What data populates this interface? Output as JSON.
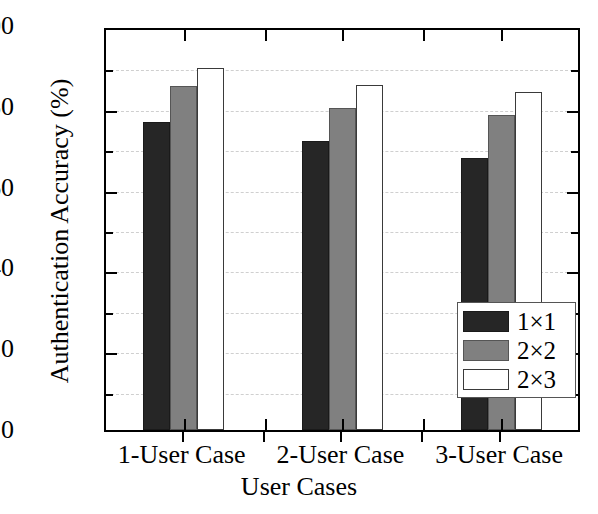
{
  "chart_data": {
    "type": "bar",
    "title": "",
    "xlabel": "User Cases",
    "ylabel": "Authentication Accuracy (%)",
    "categories": [
      "1-User Case",
      "2-User Case",
      "3-User Case"
    ],
    "series": [
      {
        "name": "1×1",
        "color": "#262626",
        "values": [
          76.2,
          71.5,
          67.3
        ]
      },
      {
        "name": "2×2",
        "color": "#808080",
        "values": [
          85.2,
          79.6,
          78.0
        ]
      },
      {
        "name": "2×3",
        "color": "#ffffff",
        "values": [
          89.7,
          85.5,
          83.6
        ]
      }
    ],
    "ylim": [
      0,
      100
    ],
    "ytick_labels": [
      "0",
      "20",
      "40",
      "60",
      "80",
      "100"
    ],
    "ytick_values": [
      0,
      20,
      40,
      60,
      80,
      100
    ],
    "yminor_values": [
      10,
      30,
      50,
      70,
      90
    ],
    "grid": "horizontal-dashed",
    "legend_position": "bottom-right",
    "frame": "box"
  },
  "axes": {
    "y_title": "Authentication Accuracy (%)",
    "x_title": "User Cases"
  },
  "legend": {
    "entries": [
      {
        "label": "1×1"
      },
      {
        "label": "2×2"
      },
      {
        "label": "2×3"
      }
    ]
  }
}
